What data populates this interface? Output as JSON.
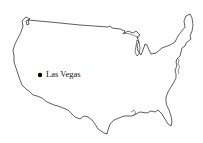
{
  "map": {
    "region": "United States (contiguous)",
    "outline_color": "#1a1a1a",
    "background": "#ffffff",
    "markers": [
      {
        "label": "Las Vegas",
        "icon": "filled-circle-icon",
        "x": 40,
        "y": 75
      }
    ]
  }
}
